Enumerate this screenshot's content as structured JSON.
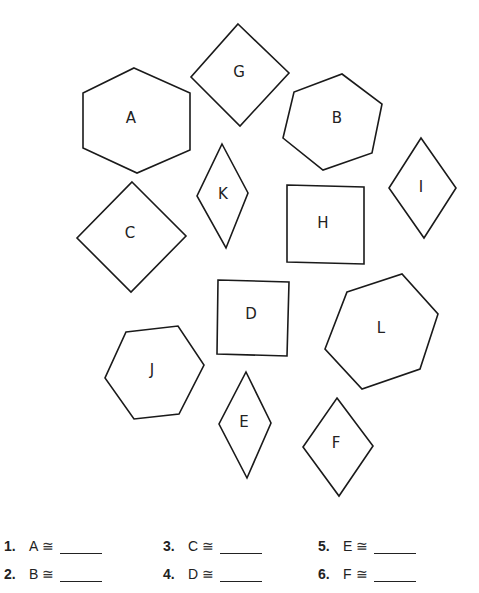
{
  "figure": {
    "shapes": [
      {
        "label": "A",
        "type": "hexagon",
        "points": "134,68 190,93 190,150 137,173 83,148 83,93",
        "label_pos": [
          131,
          118
        ]
      },
      {
        "label": "G",
        "type": "square",
        "points": "238,24 289,73 240,126 191,77",
        "label_pos": [
          239,
          72
        ]
      },
      {
        "label": "B",
        "type": "hexagon",
        "points": "342,74 382,104 372,153 323,170 283,138 294,92",
        "label_pos": [
          337,
          118
        ]
      },
      {
        "label": "I",
        "type": "rhombus",
        "points": "421,138 456,188 424,238 389,188",
        "label_pos": [
          421,
          187
        ]
      },
      {
        "label": "K",
        "type": "rhombus",
        "points": "222,144 248,193 226,248 197,196",
        "label_pos": [
          223,
          194
        ]
      },
      {
        "label": "H",
        "type": "square",
        "points": "287,185 364,187 364,264 287,262",
        "label_pos": [
          323,
          223
        ]
      },
      {
        "label": "C",
        "type": "square",
        "points": "132,182 186,236 131,292 77,238",
        "label_pos": [
          130,
          233
        ]
      },
      {
        "label": "D",
        "type": "square",
        "points": "218,280 289,282 287,356 217,354",
        "label_pos": [
          251,
          314
        ]
      },
      {
        "label": "L",
        "type": "hexagon",
        "points": "347,292 402,274 438,314 420,369 362,389 325,349",
        "label_pos": [
          381,
          328
        ]
      },
      {
        "label": "J",
        "type": "hexagon",
        "points": "126,332 178,326 204,365 179,414 134,419 105,378",
        "label_pos": [
          152,
          370
        ]
      },
      {
        "label": "E",
        "type": "rhombus",
        "points": "246,372 271,423 247,478 219,424",
        "label_pos": [
          244,
          422
        ]
      },
      {
        "label": "F",
        "type": "rhombus",
        "points": "337,398 373,446 339,496 303,447",
        "label_pos": [
          336,
          443
        ]
      }
    ]
  },
  "questions": [
    {
      "number": "1.",
      "shape": "A",
      "symbol": "≅",
      "answer": ""
    },
    {
      "number": "2.",
      "shape": "B",
      "symbol": "≅",
      "answer": ""
    },
    {
      "number": "3.",
      "shape": "C",
      "symbol": "≅",
      "answer": ""
    },
    {
      "number": "4.",
      "shape": "D",
      "symbol": "≅",
      "answer": ""
    },
    {
      "number": "5.",
      "shape": "E",
      "symbol": "≅",
      "answer": ""
    },
    {
      "number": "6.",
      "shape": "F",
      "symbol": "≅",
      "answer": ""
    }
  ]
}
